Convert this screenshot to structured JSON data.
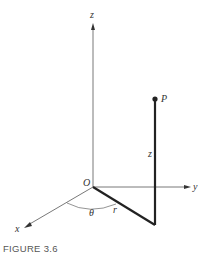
{
  "figure": {
    "caption": "FIGURE 3.6",
    "labels": {
      "z_axis": "z",
      "y_axis": "y",
      "x_axis": "x",
      "origin": "O",
      "point": "P",
      "height": "z",
      "radius": "r",
      "angle": "θ"
    },
    "colors": {
      "axis": "#555555",
      "thick": "#222222"
    }
  }
}
